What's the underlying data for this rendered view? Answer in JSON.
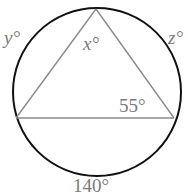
{
  "diagram": {
    "type": "inscribed-triangle-in-circle",
    "circle": {
      "cx": 97,
      "cy": 92,
      "r": 84,
      "stroke": "#111111"
    },
    "triangle": {
      "vertices": {
        "top": [
          96,
          9
        ],
        "left": [
          16,
          118
        ],
        "right": [
          174,
          118
        ]
      },
      "stroke": "#8a8a8a"
    },
    "labels": {
      "y": "y°",
      "x": "x°",
      "z": "z°",
      "angle_right": "55°",
      "arc_bottom": "140°"
    }
  }
}
